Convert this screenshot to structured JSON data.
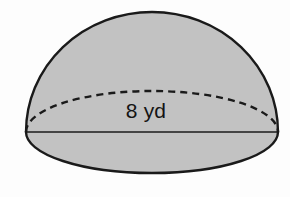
{
  "figure": {
    "name": "hemisphere-diagram",
    "shape_type": "hemisphere",
    "background_color": "#fdfdfd",
    "fill_color": "#c2c2c2",
    "stroke_color": "#1a1a1a",
    "stroke_width": 2.4,
    "dash_pattern": "7 5",
    "geometry": {
      "center_x": 152,
      "base_y": 132,
      "radius_x": 126,
      "base_ellipse_ry": 41,
      "dome_top_y": 12,
      "base_front_bottom_y": 173,
      "base_back_top_y": 93,
      "left_edge_x": 26,
      "right_edge_x": 278
    },
    "labels": {
      "diameter": {
        "text": "8 yd",
        "value": 8,
        "unit": "yd",
        "measures": "diameter",
        "color": "#141414",
        "font_size_px": 21
      }
    },
    "elements": {
      "dome_surface": "dome-surface",
      "base_front_arc": "base-front-arc",
      "base_back_arc_dashed": "base-back-arc-dashed",
      "diameter_line": "diameter-line"
    }
  }
}
